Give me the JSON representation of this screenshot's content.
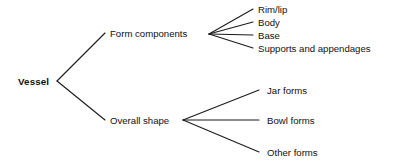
{
  "diagram": {
    "type": "tree",
    "line_color": "#1a1a1a",
    "text_color": "#101010",
    "background": "#ffffff",
    "root": {
      "label": "Vessel",
      "x": 18,
      "y": 81
    },
    "branches": [
      {
        "id": "form-components",
        "label": "Form components",
        "x": 110,
        "y": 33,
        "fan_vertex_x": 209,
        "fan_vertex_y": 34,
        "leaves": [
          {
            "id": "rim-lip",
            "label": "Rim/lip",
            "x": 258,
            "y": 9,
            "end_x": 253
          },
          {
            "id": "body",
            "label": "Body",
            "x": 258,
            "y": 22,
            "end_x": 253
          },
          {
            "id": "base",
            "label": "Base",
            "x": 258,
            "y": 35,
            "end_x": 253
          },
          {
            "id": "supports-and-appendages",
            "label": "Supports and appendages",
            "x": 258,
            "y": 48,
            "end_x": 253
          }
        ]
      },
      {
        "id": "overall-shape",
        "label": "Overall shape",
        "x": 110,
        "y": 120,
        "fan_vertex_x": 183,
        "fan_vertex_y": 120,
        "leaves": [
          {
            "id": "jar-forms",
            "label": "Jar forms",
            "x": 267,
            "y": 90,
            "end_x": 259
          },
          {
            "id": "bowl-forms",
            "label": "Bowl forms",
            "x": 267,
            "y": 120,
            "end_x": 259
          },
          {
            "id": "other-forms",
            "label": "Other forms",
            "x": 267,
            "y": 152,
            "end_x": 259
          }
        ]
      }
    ]
  }
}
